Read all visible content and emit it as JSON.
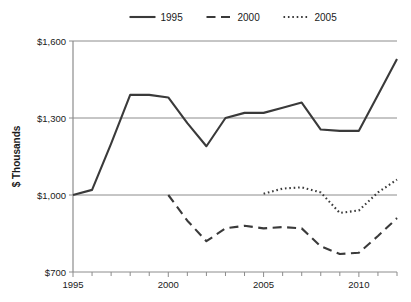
{
  "chart_data": {
    "type": "line",
    "title": "",
    "xlabel": "",
    "ylabel": "$ Thousands",
    "xlim": [
      1995,
      2012
    ],
    "ylim": [
      700,
      1600
    ],
    "grid": true,
    "legend_position": "top",
    "y_ticks": [
      "$700",
      "$1,000",
      "$1,300",
      "$1,600"
    ],
    "y_tick_values": [
      700,
      1000,
      1300,
      1600
    ],
    "x_ticks": [
      "1995",
      "2000",
      "2005",
      "2010"
    ],
    "x_tick_values": [
      1995,
      2000,
      2005,
      2010
    ],
    "x_minor_ticks": [
      1995,
      1996,
      1997,
      1998,
      1999,
      2000,
      2001,
      2002,
      2003,
      2004,
      2005,
      2006,
      2007,
      2008,
      2009,
      2010,
      2011,
      2012
    ],
    "series": [
      {
        "name": "1995",
        "style": "solid",
        "x": [
          1995,
          1996,
          1997,
          1998,
          1999,
          2000,
          2001,
          2002,
          2003,
          2004,
          2005,
          2006,
          2007,
          2008,
          2009,
          2010,
          2011,
          2012
        ],
        "values": [
          1000,
          1020,
          1200,
          1390,
          1390,
          1380,
          1280,
          1190,
          1300,
          1320,
          1320,
          1340,
          1360,
          1255,
          1250,
          1250,
          1390,
          1530
        ]
      },
      {
        "name": "2000",
        "style": "dashed",
        "x": [
          2000,
          2001,
          2002,
          2003,
          2004,
          2005,
          2006,
          2007,
          2008,
          2009,
          2010,
          2011,
          2012
        ],
        "values": [
          1000,
          900,
          820,
          870,
          880,
          870,
          875,
          870,
          800,
          770,
          775,
          840,
          910
        ]
      },
      {
        "name": "2005",
        "style": "dotted",
        "x": [
          2005,
          2006,
          2007,
          2008,
          2009,
          2010,
          2011,
          2012
        ],
        "values": [
          1005,
          1025,
          1030,
          1010,
          930,
          940,
          1010,
          1060
        ]
      }
    ]
  },
  "legend": {
    "items": [
      {
        "label": "1995",
        "style": "solid"
      },
      {
        "label": "2000",
        "style": "dashed"
      },
      {
        "label": "2005",
        "style": "dotted"
      }
    ]
  },
  "colors": {
    "line": "#3a3a3a",
    "grid": "#8c8c8c",
    "text": "#1a1a1a",
    "background": "#ffffff"
  }
}
